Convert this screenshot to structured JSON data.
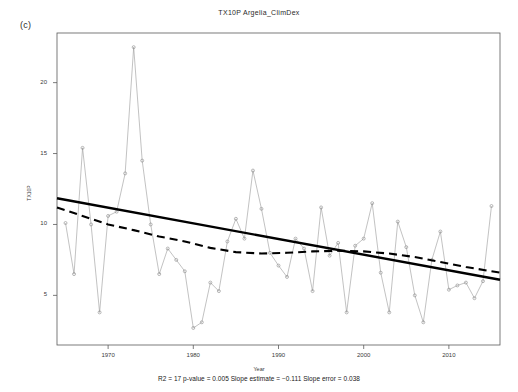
{
  "panel": {
    "label": "(c)"
  },
  "caption": {
    "text": "R2 = 17  p-value = 0.005  Slope estimate = −0.111  Slope error = 0.038"
  },
  "axis_titles": {
    "x": "Year",
    "y": "TX10P"
  },
  "chart_data": {
    "type": "line",
    "title": "TX10P  Argelia_ClimDex",
    "subtitle": "",
    "xlabel": "Year",
    "ylabel": "TX10P",
    "xlim": [
      1964,
      2016
    ],
    "ylim": [
      1.5,
      23.5
    ],
    "xticks": [
      1970,
      1980,
      1990,
      2000,
      2010
    ],
    "xticklabels": [
      "1970",
      "1980",
      "1990",
      "2000",
      "2010"
    ],
    "yticks": [
      5,
      10,
      15,
      20
    ],
    "yticklabels": [
      "5",
      "10",
      "15",
      "20"
    ],
    "grid": false,
    "legend": null,
    "marker": "open-circle",
    "series": [
      {
        "name": "TX10P annual index",
        "style": "thin-gray-line-with-open-circle-markers",
        "color": "#999999",
        "x": [
          1965,
          1966,
          1967,
          1968,
          1969,
          1970,
          1971,
          1972,
          1973,
          1974,
          1975,
          1976,
          1977,
          1978,
          1979,
          1980,
          1981,
          1982,
          1983,
          1984,
          1985,
          1986,
          1987,
          1988,
          1989,
          1990,
          1991,
          1992,
          1993,
          1994,
          1995,
          1996,
          1997,
          1998,
          1999,
          2000,
          2001,
          2002,
          2003,
          2004,
          2005,
          2006,
          2007,
          2008,
          2009,
          2010,
          2011,
          2012,
          2013,
          2014,
          2015
        ],
        "values": [
          10.1,
          6.5,
          15.4,
          10.0,
          3.8,
          10.6,
          10.9,
          13.6,
          22.5,
          14.5,
          10.0,
          6.5,
          8.3,
          7.5,
          6.7,
          2.7,
          3.1,
          5.9,
          5.3,
          8.8,
          10.4,
          9.0,
          13.8,
          11.1,
          8.0,
          7.1,
          6.3,
          9.0,
          8.3,
          5.3,
          11.2,
          7.8,
          8.7,
          3.8,
          8.5,
          9.0,
          11.5,
          6.6,
          3.8,
          10.2,
          8.4,
          5.0,
          3.1,
          7.5,
          9.5,
          5.4,
          5.7,
          5.9,
          4.8,
          6.0,
          11.3
        ]
      },
      {
        "name": "Linear trend",
        "style": "thick-solid-black-line",
        "color": "#000000",
        "x": [
          1964,
          2016
        ],
        "values": [
          11.85,
          6.1
        ]
      },
      {
        "name": "LOWESS smooth",
        "style": "thick-dashed-black-line",
        "color": "#000000",
        "x": [
          1964,
          1967,
          1970,
          1973,
          1976,
          1979,
          1982,
          1985,
          1988,
          1991,
          1994,
          1997,
          2000,
          2003,
          2006,
          2009,
          2012,
          2016
        ],
        "values": [
          11.2,
          10.6,
          10.0,
          9.6,
          9.15,
          8.8,
          8.35,
          8.05,
          7.95,
          8.0,
          8.1,
          8.15,
          8.1,
          7.95,
          7.7,
          7.35,
          7.0,
          6.6
        ]
      }
    ],
    "annotations": [
      {
        "text": "(c)",
        "position": "top-left-outside"
      },
      {
        "text": "R2 = 17  p-value = 0.005  Slope estimate = −0.111  Slope error = 0.038",
        "position": "bottom-center"
      }
    ],
    "statistics": {
      "r2": "17",
      "p_value": "0.005",
      "slope_estimate": "−0.111",
      "slope_error": "0.038"
    }
  }
}
